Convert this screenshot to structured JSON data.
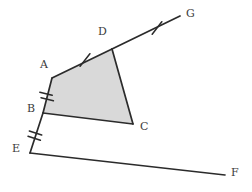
{
  "figure": {
    "type": "geometry-diagram",
    "background_color": "#ffffff",
    "stroke_color": "#2b2b2b",
    "fill_color": "#d9d9d9",
    "label_color": "#3b3b3b",
    "stroke_width": 1.6,
    "tick_width": 1.4
  },
  "points": {
    "A": {
      "label": "A",
      "x": 52,
      "y": 78,
      "label_x": 40,
      "label_y": 59
    },
    "B": {
      "label": "B",
      "x": 43,
      "y": 113,
      "label_x": 27,
      "label_y": 103
    },
    "C": {
      "label": "C",
      "x": 133,
      "y": 124,
      "label_x": 140,
      "label_y": 121
    },
    "D": {
      "label": "D",
      "x": 112,
      "y": 49,
      "label_x": 98,
      "label_y": 26
    },
    "E": {
      "label": "E",
      "x": 30,
      "y": 153,
      "label_x": 12,
      "label_y": 143
    },
    "F": {
      "label": "F",
      "x": 225,
      "y": 175,
      "label_x": 231,
      "label_y": 167
    },
    "G": {
      "label": "G",
      "x": 180,
      "y": 16,
      "label_x": 186,
      "label_y": 8
    }
  },
  "polygon": {
    "name": "ABCD",
    "vertices": [
      "A",
      "B",
      "C",
      "D"
    ],
    "filled": true
  },
  "segments": [
    {
      "name": "segment-AD",
      "from": "A",
      "to": "D",
      "ticks": 1
    },
    {
      "name": "segment-DG",
      "from": "D",
      "to": "G",
      "ticks": 1
    },
    {
      "name": "segment-AB",
      "from": "A",
      "to": "B",
      "ticks": 2
    },
    {
      "name": "segment-BE",
      "from": "B",
      "to": "E",
      "ticks": 2
    },
    {
      "name": "segment-BC",
      "from": "B",
      "to": "C",
      "ticks": 0
    },
    {
      "name": "segment-CD",
      "from": "C",
      "to": "D",
      "ticks": 0
    },
    {
      "name": "segment-EF",
      "from": "E",
      "to": "F",
      "ticks": 0
    }
  ],
  "tick_marks": [
    {
      "name": "tick-AD",
      "on": "segment-AD",
      "count": 1,
      "x": 85,
      "y": 60,
      "length": 13,
      "angle_deg": -24
    },
    {
      "name": "tick-DG",
      "on": "segment-DG",
      "count": 1,
      "x": 157,
      "y": 28,
      "length": 13,
      "angle_deg": -25
    },
    {
      "name": "tick-AB",
      "on": "segment-AB",
      "count": 2,
      "x": 47,
      "y": 95,
      "length": 13,
      "angle_deg": 76,
      "spacing": 4
    },
    {
      "name": "tick-BE",
      "on": "segment-BE",
      "count": 2,
      "x": 36,
      "y": 134,
      "length": 13,
      "angle_deg": 72,
      "spacing": 4
    }
  ],
  "labels_order": [
    "G",
    "D",
    "A",
    "B",
    "C",
    "E",
    "F"
  ]
}
